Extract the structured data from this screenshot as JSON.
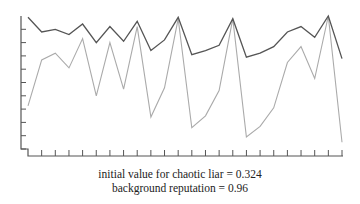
{
  "chart_data": {
    "type": "line",
    "title": "",
    "xlabel": "",
    "ylabel": "",
    "ylim": [
      0,
      1
    ],
    "grid": false,
    "legend": null,
    "x": [
      0,
      1,
      2,
      3,
      4,
      5,
      6,
      7,
      8,
      9,
      10,
      11,
      12,
      13,
      14,
      15,
      16,
      17,
      18,
      19,
      20,
      21,
      22,
      23
    ],
    "series": [
      {
        "name": "reputation (dark line)",
        "color": "#555555",
        "values": [
          0.99,
          0.88,
          0.9,
          0.86,
          0.94,
          0.8,
          0.92,
          0.81,
          0.96,
          0.74,
          0.82,
          0.99,
          0.71,
          0.74,
          0.78,
          0.98,
          0.69,
          0.72,
          0.77,
          0.88,
          0.92,
          0.84,
          1.0,
          0.68
        ]
      },
      {
        "name": "chaotic liar (light line)",
        "color": "#aaaaaa",
        "values": [
          0.324,
          0.67,
          0.72,
          0.61,
          0.83,
          0.4,
          0.8,
          0.45,
          0.92,
          0.24,
          0.46,
          0.98,
          0.16,
          0.25,
          0.44,
          0.98,
          0.09,
          0.17,
          0.31,
          0.65,
          0.77,
          0.53,
          1.0,
          0.05
        ]
      }
    ],
    "y_tick_count": 10,
    "x_tick_count": 23,
    "annotations": [
      "initial value for chaotic liar = 0.324",
      "background reputation = 0.96"
    ]
  },
  "caption": {
    "line1": "initial value for chaotic liar = 0.324",
    "line2": "background reputation = 0.96"
  },
  "colors": {
    "axis": "#555555",
    "dark_line": "#555555",
    "light_line": "#aaaaaa",
    "text": "#222222"
  }
}
